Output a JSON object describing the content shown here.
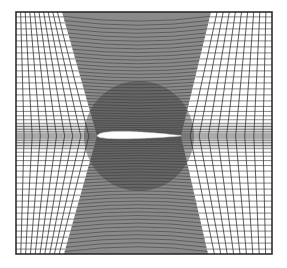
{
  "figure": {
    "type": "structured-mesh",
    "frame": {
      "x0": 16,
      "y0": 12,
      "x1": 272,
      "y1": 254,
      "stroke": "#222222"
    },
    "airfoil": {
      "leading_edge_x": 97,
      "trailing_edge_x": 181,
      "chord_y": 136,
      "fill": "#ffffff"
    },
    "dense_zone": {
      "top_left_x": 62,
      "top_right_x": 211,
      "mid_left_x": 97,
      "mid_right_x": 181,
      "bottom_left_x": 64,
      "bottom_right_x": 208,
      "line_color": "#3a3a3a",
      "shade_color": "#8a8a8a"
    },
    "outer_grid": {
      "line_color": "#333333",
      "wake_band_color": "#a0a0a0",
      "vertical_lines_per_side": 9,
      "horizontal_spacing_far": 6,
      "horizontal_spacing_near": 2
    }
  }
}
